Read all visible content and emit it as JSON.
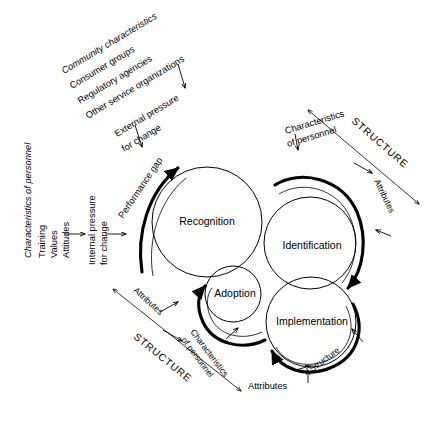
{
  "figure": {
    "background_color": "#ffffff",
    "stroke_color": "#000000",
    "width": 435,
    "height": 427
  },
  "external_inputs": {
    "heading": "Community characteristics",
    "items": [
      "Consumer groups",
      "Regulatory agencies",
      "Other service organizations"
    ],
    "pressure_label_line1": "External pressure",
    "pressure_label_line2": "for change"
  },
  "internal_inputs": {
    "heading": "Characteristics of personnel",
    "items": [
      "Training",
      "Values",
      "Attitudes"
    ],
    "pressure_label_line1": "Internal pressure",
    "pressure_label_line2": "for change"
  },
  "performance_gap_label": "Performance gap",
  "stages": [
    {
      "id": "recognition",
      "label": "Recognition",
      "cx": 207,
      "cy": 222,
      "r": 55
    },
    {
      "id": "identification",
      "label": "Identification",
      "cx": 310,
      "cy": 243,
      "r": 46
    },
    {
      "id": "adoption",
      "label": "Adoption",
      "cx": 233,
      "cy": 294,
      "r": 28
    },
    {
      "id": "implementation",
      "label": "Implementation",
      "cx": 311,
      "cy": 322,
      "r": 45
    }
  ],
  "structure_top_right": {
    "structure_label": "STRUCTURE",
    "characteristics_line1": "Characteristics",
    "characteristics_line2": "of personnel",
    "attributes_label": "Attributes"
  },
  "structure_bottom_left": {
    "structure_label": "STRUCTURE",
    "characteristics_line1": "Characteristics",
    "characteristics_line2": "of personnel",
    "attributes_label": "Attributes"
  },
  "implementation_annotations": {
    "structure_label": "Structure",
    "attributes_label": "Attributes"
  }
}
